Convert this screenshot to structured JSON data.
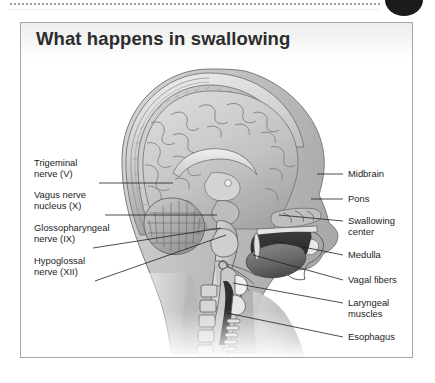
{
  "page": {
    "background_color": "#ffffff",
    "rule_color": "#8e8e8e",
    "badge_color": "#1b1b1b"
  },
  "panel": {
    "title": "What happens in swallowing",
    "border_color": "#a6a6a6",
    "text_color": "#232323"
  },
  "figure": {
    "labels_left": [
      {
        "text": "Trigeminal\nnerve (V)",
        "x": 13,
        "y": 140,
        "leader": {
          "x1": 78,
          "y1": 160,
          "x2": 152,
          "y2": 160
        }
      },
      {
        "text": "Vagus nerve\nnucleus (X)",
        "x": 13,
        "y": 172,
        "leader": {
          "x1": 84,
          "y1": 192,
          "x2": 196,
          "y2": 192
        }
      },
      {
        "text": "Glossopharyngeal\nnerve (IX)",
        "x": 13,
        "y": 205,
        "leader": {
          "x1": 72,
          "y1": 225,
          "x2": 200,
          "y2": 205
        }
      },
      {
        "text": "Hypoglossal\nnerve (XII)",
        "x": 13,
        "y": 238,
        "leader": {
          "x1": 74,
          "y1": 258,
          "x2": 205,
          "y2": 212
        }
      }
    ],
    "labels_right": [
      {
        "text": "Midbrain",
        "x": 327,
        "y": 147,
        "leader": {
          "x1": 312,
          "y1": 151,
          "x2": 296,
          "y2": 151
        }
      },
      {
        "text": "Pons",
        "x": 327,
        "y": 172,
        "leader": {
          "x1": 312,
          "y1": 176,
          "x2": 290,
          "y2": 176
        }
      },
      {
        "text": "Swallowing\ncenter",
        "x": 327,
        "y": 194,
        "leader": {
          "x1": 312,
          "y1": 198,
          "x2": 258,
          "y2": 192
        }
      },
      {
        "text": "Medulla",
        "x": 327,
        "y": 228,
        "leader": {
          "x1": 312,
          "y1": 232,
          "x2": 252,
          "y2": 218
        }
      },
      {
        "text": "Vagal fibers",
        "x": 327,
        "y": 253,
        "leader": {
          "x1": 312,
          "y1": 257,
          "x2": 232,
          "y2": 232
        }
      },
      {
        "text": "Laryngeal\nmuscles",
        "x": 327,
        "y": 276,
        "leader": {
          "x1": 312,
          "y1": 280,
          "x2": 212,
          "y2": 260
        }
      },
      {
        "text": "Esophagus",
        "x": 327,
        "y": 310,
        "leader": {
          "x1": 312,
          "y1": 314,
          "x2": 206,
          "y2": 290
        }
      }
    ]
  }
}
